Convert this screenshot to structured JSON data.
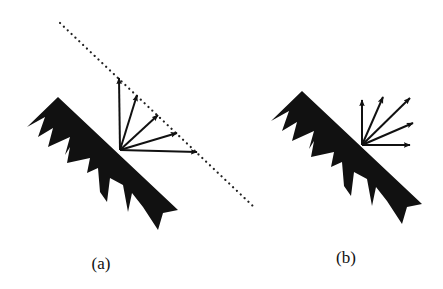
{
  "figure": {
    "background": "#ffffff",
    "ink_color": "#111111",
    "panels": [
      {
        "id": "a",
        "label": "(a)",
        "label_pos": [
          101,
          264
        ],
        "surface": "rough sawtooth surface (black)",
        "offset": [
          0,
          0
        ],
        "reflection_origin": [
          120,
          150
        ],
        "arrow_tips": [
          [
            119,
            78
          ],
          [
            137,
            95
          ],
          [
            158,
            115
          ],
          [
            177,
            133
          ],
          [
            197,
            152
          ]
        ],
        "envelope": {
          "style": "dotted",
          "from": [
            60,
            23
          ],
          "to": [
            255,
            208
          ]
        }
      },
      {
        "id": "b",
        "label": "(b)",
        "label_pos": [
          346,
          258
        ],
        "surface": "rough sawtooth surface (black)",
        "offset": [
          244,
          -6
        ],
        "reflection_origin": [
          362,
          145
        ],
        "arrow_tips": [
          [
            362,
            100
          ],
          [
            383,
            97
          ],
          [
            410,
            98
          ],
          [
            413,
            123
          ],
          [
            410,
            145
          ]
        ]
      }
    ]
  }
}
